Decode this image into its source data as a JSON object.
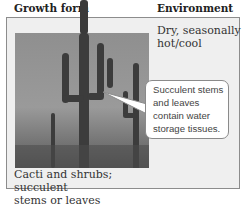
{
  "headers": {
    "growth_form": "Growth form",
    "environment": "Environment"
  },
  "environment_text": {
    "line1": "Dry, seasonally",
    "line2": "hot/cool"
  },
  "callout": {
    "line1": "Succulent stems",
    "line2": "and leaves",
    "line3": "contain water",
    "line4": "storage tissues."
  },
  "caption": {
    "line1": "Cacti and shrubs; succulent",
    "line2": "stems or leaves"
  },
  "photo": {
    "subject": "saguaro-cactus-desert-photo"
  },
  "colors": {
    "panel_bg": "#efefef",
    "panel_border": "#8c8c8c",
    "callout_bg": "#ffffff"
  }
}
